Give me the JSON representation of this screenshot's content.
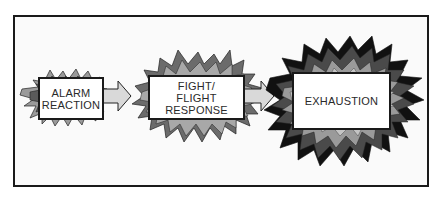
{
  "diagram": {
    "stages": [
      {
        "label": "ALARM\nREACTION",
        "order": 1
      },
      {
        "label": "FIGHT/\nFLIGHT\nRESPONSE",
        "order": 2
      },
      {
        "label": "EXHAUSTION",
        "order": 3
      }
    ],
    "connectors": [
      "arrow-right",
      "arrow-right"
    ],
    "colors": {
      "frame_border": "#1a1a1a",
      "background": "#fafafa",
      "box_fill": "#ffffff",
      "arrow_fill": "#d9d9d9",
      "burst_light": "#bdbdbd",
      "burst_mid": "#8a8a8a",
      "burst_dark": "#4a4a4a",
      "burst_black": "#111111"
    }
  }
}
